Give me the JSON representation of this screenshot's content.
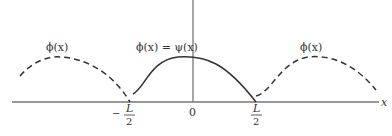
{
  "figure": {
    "type": "periodic-extension-diagram",
    "axis": {
      "x_label": "x",
      "origin_label": "0"
    },
    "ticks": [
      {
        "id": "neg-half-L",
        "sign": "−",
        "numerator": "L",
        "denominator": "2"
      },
      {
        "id": "pos-half-L",
        "sign": "",
        "numerator": "L",
        "denominator": "2"
      }
    ],
    "curves": [
      {
        "id": "left-extension",
        "style": "dashed",
        "label": "ϕ(x)"
      },
      {
        "id": "central",
        "style": "solid",
        "label": "ϕ(x) = ψ(x)"
      },
      {
        "id": "right-extension",
        "style": "dashed",
        "label": "ϕ(x)"
      }
    ],
    "colors": {
      "axis": "#777777",
      "curve": "#333333"
    }
  }
}
